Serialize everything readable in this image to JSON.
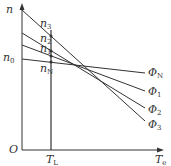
{
  "diagram": {
    "y_axis": {
      "label": "n"
    },
    "x_axis": {
      "label": "T",
      "label_sub": "e"
    },
    "origin": {
      "label": "O"
    },
    "vertical_marker": {
      "label": "T",
      "label_sub": "L"
    },
    "n0": {
      "label": "n",
      "sub": "0"
    },
    "points": [
      {
        "label": "n",
        "sub": "3"
      },
      {
        "label": "n",
        "sub": "2"
      },
      {
        "label": "n",
        "sub": "1"
      },
      {
        "label": "n",
        "sub": "N"
      }
    ],
    "curves": [
      {
        "label": "Φ",
        "sub": "N"
      },
      {
        "label": "Φ",
        "sub": "1"
      },
      {
        "label": "Φ",
        "sub": "2"
      },
      {
        "label": "Φ",
        "sub": "3"
      }
    ]
  }
}
